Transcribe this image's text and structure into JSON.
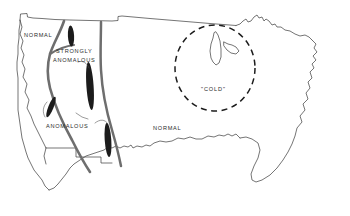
{
  "figure": {
    "kind": "hand-drawn-map",
    "region": "contiguous-united-states",
    "background_color": "#ffffff",
    "outline_color": "#3a3a3a",
    "anomaly_band_color": "#6e6e6e",
    "anomaly_core_color": "#1c1c1c",
    "dashed_circle_color": "#1c1c1c"
  },
  "labels": {
    "normal_northwest": "NORMAL",
    "strongly_anomalous_line1": "STRONGLY",
    "strongly_anomalous_line2": "ANOMALOUS",
    "anomalous": "ANOMALOUS",
    "normal_central": "NORMAL",
    "cold": "\"COLD\""
  },
  "annotations": {
    "dashed_circle": {
      "name": "cold-region-circle",
      "center_x": 215,
      "center_y": 68,
      "radius_x": 40,
      "radius_y": 43,
      "style": "dashed"
    },
    "bands": [
      {
        "name": "western-anomaly-band-outer",
        "description": "thick gray curve from Canadian border south through Great Basin to Mexican border"
      },
      {
        "name": "western-anomaly-band-inner",
        "description": "thick gray curve along Sierra Nevada / Cascades"
      },
      {
        "name": "eastern-anomaly-band",
        "description": "thick gray curve down the Rocky Mountain front"
      }
    ],
    "cores": [
      {
        "name": "anomaly-core-north",
        "description": "black elongated ellipse near Idaho/Montana border"
      },
      {
        "name": "anomaly-core-central",
        "description": "black elongated ellipse over Nevada/Utah"
      },
      {
        "name": "anomaly-core-southwest",
        "description": "black elongated ellipse over southern California/Arizona"
      },
      {
        "name": "anomaly-core-south",
        "description": "black elongated ellipse over New Mexico"
      }
    ],
    "leader_lines": [
      {
        "name": "leader-line-anomalous",
        "description": "thin curve from ANOMALOUS label to southwest core"
      },
      {
        "name": "leader-line-south-core",
        "description": "thin curve from ANOMALOUS label to south core"
      }
    ]
  }
}
